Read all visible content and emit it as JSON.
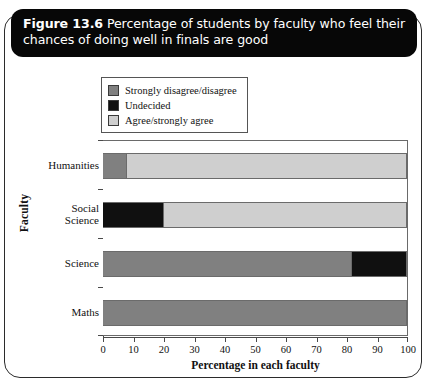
{
  "caption": {
    "label": "Figure 13.6",
    "text": "Percentage of students by faculty who feel their chances of doing well in finals are good"
  },
  "colors": {
    "strongly_disagree": "#808080",
    "undecided": "#101010",
    "agree": "#cfcfcf",
    "frame": "#6a6a6a",
    "banner_bg": "#070707"
  },
  "chart_data": {
    "type": "bar",
    "orientation": "horizontal",
    "stacked": true,
    "title": "Percentage of students by faculty who feel their chances of doing well in finals are good",
    "xlabel": "Percentage in each faculty",
    "ylabel": "Faculty",
    "categories": [
      "Humanities",
      "Social Science",
      "Science",
      "Maths"
    ],
    "category_lines": [
      [
        "Humanities"
      ],
      [
        "Social",
        "Science"
      ],
      [
        "Science"
      ],
      [
        "Maths"
      ]
    ],
    "series": [
      {
        "name": "Strongly disagree/disagree",
        "color": "#808080",
        "values": [
          8,
          0,
          82,
          100
        ]
      },
      {
        "name": "Undecided",
        "color": "#101010",
        "values": [
          0,
          20,
          18,
          0
        ]
      },
      {
        "name": "Agree/strongly agree",
        "color": "#cfcfcf",
        "values": [
          92,
          80,
          0,
          0
        ]
      }
    ],
    "xlim": [
      0,
      100
    ],
    "xticks": [
      0,
      10,
      20,
      30,
      40,
      50,
      60,
      70,
      80,
      90,
      100
    ],
    "xtick_labels": [
      "0",
      "10",
      "20",
      "30",
      "40",
      "50",
      "60",
      "70",
      "80",
      "90",
      "100"
    ],
    "grid": false,
    "legend_position": "top-center"
  }
}
